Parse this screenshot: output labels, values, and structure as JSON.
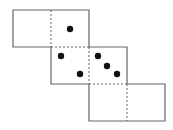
{
  "diagram": {
    "type": "cube-net",
    "faces": [
      {
        "id": "f1",
        "x": 13,
        "y": 10,
        "dots": []
      },
      {
        "id": "f2",
        "x": 51,
        "y": 10,
        "dots": [
          [
            70,
            29
          ]
        ]
      },
      {
        "id": "f3",
        "x": 51,
        "y": 47,
        "dots": [
          [
            61,
            56
          ],
          [
            80,
            74
          ]
        ]
      },
      {
        "id": "f4",
        "x": 89,
        "y": 47,
        "dots": [
          [
            98,
            56
          ],
          [
            107,
            66
          ],
          [
            117,
            74
          ]
        ]
      },
      {
        "id": "f5",
        "x": 89,
        "y": 84,
        "dots": []
      },
      {
        "id": "f6",
        "x": 127,
        "y": 84,
        "dots": []
      }
    ],
    "size": 38,
    "line_color": "#666666",
    "dot_color": "#111111"
  }
}
